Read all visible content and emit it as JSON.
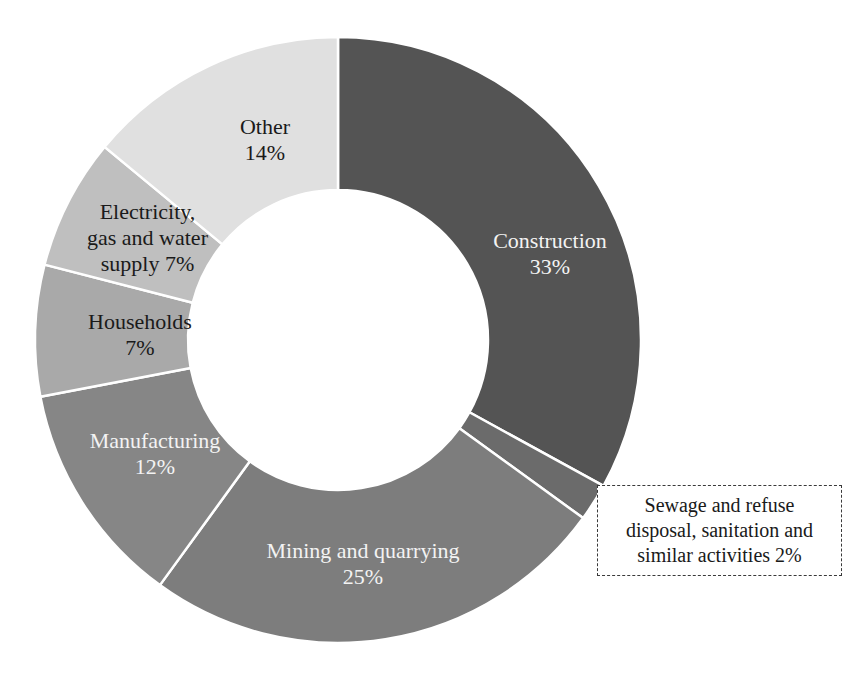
{
  "chart_data": {
    "type": "pie",
    "variant": "donut",
    "title": "",
    "subtitle": "",
    "xlabel": "",
    "ylabel": "",
    "legend_position": "none",
    "grid": false,
    "units": "percent",
    "total": 100,
    "start_angle_deg": 0,
    "direction": "clockwise",
    "inner_radius_ratio": 0.495,
    "categories": [
      "Construction",
      "Sewage and refuse disposal, sanitation and similar activities",
      "Mining and quarrying",
      "Manufacturing",
      "Households",
      "Electricity, gas and water supply",
      "Other"
    ],
    "values": [
      33,
      2,
      25,
      12,
      7,
      7,
      14
    ],
    "colors": [
      "#545454",
      "#6b6b6b",
      "#7d7d7d",
      "#868686",
      "#a9a9a9",
      "#bfbfbf",
      "#e0e0e0"
    ],
    "slices": [
      {
        "name": "Construction",
        "value": 33,
        "value_label": "33%",
        "label_lines": "Construction\n33%",
        "color": "#545454",
        "label_style": "light",
        "label_placement": "inside"
      },
      {
        "name": "Sewage and refuse disposal, sanitation and similar activities",
        "value": 2,
        "value_label": "2%",
        "label_lines": "Sewage and refuse\ndisposal, sanitation and\nsimilar activities 2%",
        "color": "#6b6b6b",
        "label_style": "dark",
        "label_placement": "callout-box"
      },
      {
        "name": "Mining and quarrying",
        "value": 25,
        "value_label": "25%",
        "label_lines": "Mining and quarrying\n25%",
        "color": "#7d7d7d",
        "label_style": "light",
        "label_placement": "inside"
      },
      {
        "name": "Manufacturing",
        "value": 12,
        "value_label": "12%",
        "label_lines": "Manufacturing\n12%",
        "color": "#868686",
        "label_style": "light",
        "label_placement": "inside"
      },
      {
        "name": "Households",
        "value": 7,
        "value_label": "7%",
        "label_lines": "Households\n7%",
        "color": "#a9a9a9",
        "label_style": "dark",
        "label_placement": "inside"
      },
      {
        "name": "Electricity, gas and water supply",
        "value": 7,
        "value_label": "7%",
        "label_lines": "Electricity,\ngas and water\nsupply 7%",
        "color": "#bfbfbf",
        "label_style": "dark",
        "label_placement": "inside"
      },
      {
        "name": "Other",
        "value": 14,
        "value_label": "14%",
        "label_lines": "Other\n14%",
        "color": "#e0e0e0",
        "label_style": "dark",
        "label_placement": "inside"
      }
    ]
  },
  "labels": {
    "construction": "Construction\n33%",
    "sewage": "Sewage and refuse\ndisposal, sanitation and\nsimilar activities 2%",
    "mining": "Mining and quarrying\n25%",
    "manufacturing": "Manufacturing\n12%",
    "households": "Households\n7%",
    "electricity": "Electricity,\ngas and water\nsupply 7%",
    "other": "Other\n14%"
  }
}
